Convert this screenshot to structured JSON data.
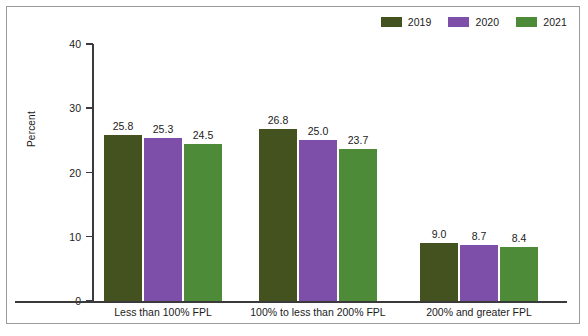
{
  "chart_data": {
    "type": "bar",
    "title": "",
    "xlabel": "",
    "ylabel": "Percent",
    "ylim": [
      0,
      40
    ],
    "yticks": [
      "0",
      "10",
      "20",
      "30",
      "40"
    ],
    "grid": false,
    "legend_position": "top-right",
    "categories": [
      "Less than 100% FPL",
      "100% to less than 200% FPL",
      "200% and greater FPL"
    ],
    "series": [
      {
        "name": "2019",
        "color": "#44521f",
        "values": [
          25.8,
          26.8,
          9.0
        ],
        "labels": [
          "25.8",
          "26.8",
          "9.0"
        ]
      },
      {
        "name": "2020",
        "color": "#7d4fa8",
        "values": [
          25.3,
          25.0,
          8.7
        ],
        "labels": [
          "25.3",
          "25.0",
          "8.7"
        ]
      },
      {
        "name": "2021",
        "color": "#4d8b39",
        "values": [
          24.5,
          23.7,
          8.4
        ],
        "labels": [
          "24.5",
          "23.7",
          "8.4"
        ]
      }
    ]
  }
}
